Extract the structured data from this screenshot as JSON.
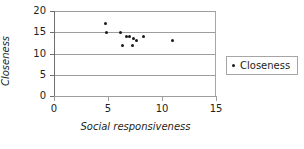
{
  "chart_data": {
    "type": "scatter",
    "title": "",
    "xlabel": "Social responsiveness",
    "ylabel": "Closeness",
    "xlim": [
      0,
      15
    ],
    "ylim": [
      0,
      20
    ],
    "xticks": [
      "0",
      "5",
      "10",
      "15"
    ],
    "xtick_values": [
      0,
      5,
      10,
      15
    ],
    "yticks": [
      "0",
      "5",
      "10",
      "15",
      "20"
    ],
    "ytick_values": [
      0,
      5,
      10,
      15,
      20
    ],
    "grid": "horizontal",
    "legend_position": "right",
    "series": [
      {
        "name": "Closeness",
        "marker": "dot",
        "color": "#1a1a1a",
        "points": [
          {
            "x": 4.8,
            "y": 17.1
          },
          {
            "x": 4.9,
            "y": 15.0
          },
          {
            "x": 6.2,
            "y": 15.0
          },
          {
            "x": 6.3,
            "y": 12.0
          },
          {
            "x": 6.7,
            "y": 14.0
          },
          {
            "x": 7.0,
            "y": 14.0
          },
          {
            "x": 7.3,
            "y": 12.0
          },
          {
            "x": 7.4,
            "y": 13.5
          },
          {
            "x": 7.6,
            "y": 13.0
          },
          {
            "x": 8.3,
            "y": 14.0
          },
          {
            "x": 11.0,
            "y": 13.0
          }
        ]
      }
    ]
  },
  "legend": {
    "entries": [
      {
        "label": "Closeness"
      }
    ]
  }
}
